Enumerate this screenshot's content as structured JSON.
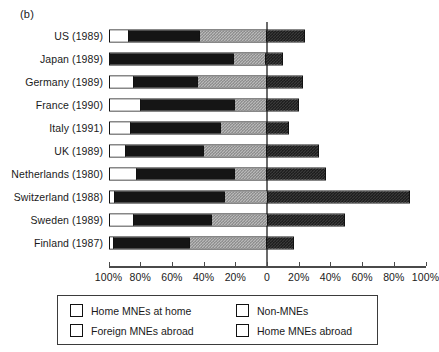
{
  "panel_label": "(b)",
  "chart_data": {
    "type": "bar",
    "orientation": "horizontal",
    "subtype": "diverging-stacked",
    "title": "",
    "xlabel": "",
    "ylabel": "",
    "grid": false,
    "legend_position": "bottom",
    "xlim": [
      -100,
      100
    ],
    "xticks": [
      -100,
      -80,
      -60,
      -40,
      -20,
      0,
      20,
      40,
      60,
      80,
      100
    ],
    "xtick_labels": [
      "100%",
      "80%",
      "60%",
      "40%",
      "20%",
      "0",
      "20%",
      "40%",
      "60%",
      "80%",
      "100%"
    ],
    "categories": [
      "US (1989)",
      "Japan (1989)",
      "Germany (1989)",
      "France (1990)",
      "Italy (1991)",
      "UK (1989)",
      "Netherlands (1980)",
      "Switzerland (1988)",
      "Sweden (1989)",
      "Finland (1987)"
    ],
    "series": [
      {
        "name": "Home MNEs at home",
        "fill": "white",
        "side": "left",
        "values": [
          12,
          0,
          15,
          20,
          13,
          10,
          17,
          3,
          15,
          2
        ]
      },
      {
        "name": "Non-MNEs",
        "fill": "black",
        "side": "left",
        "values": [
          45,
          80,
          41,
          60,
          58,
          50,
          63,
          70,
          50,
          49
        ]
      },
      {
        "name": "Foreign MNEs abroad",
        "fill": "light-dotted",
        "side": "left",
        "values": [
          43,
          20,
          44,
          20,
          29,
          40,
          20,
          27,
          35,
          49
        ]
      },
      {
        "name": "Home MNEs abroad",
        "fill": "dark-dotted",
        "side": "right",
        "values": [
          24,
          10,
          23,
          20,
          14,
          33,
          37,
          90,
          49,
          17
        ]
      }
    ]
  },
  "legend": {
    "items": [
      {
        "label": "Home MNEs at home",
        "fill": "white",
        "swatch_name": "legend-swatch-home-mnes-at-home"
      },
      {
        "label": "Non-MNEs",
        "fill": "black",
        "swatch_name": "legend-swatch-non-mnes"
      },
      {
        "label": "Foreign MNEs abroad",
        "fill": "light-dotted",
        "swatch_name": "legend-swatch-foreign-mnes-abroad"
      },
      {
        "label": "Home MNEs abroad",
        "fill": "dark-dotted",
        "swatch_name": "legend-swatch-home-mnes-abroad"
      }
    ]
  },
  "colors": {
    "black": "#151515",
    "white": "#ffffff",
    "light_dotted": "#b9b9b9",
    "dark_dotted": "#3a3a3a",
    "axis": "#4a4a4a"
  }
}
